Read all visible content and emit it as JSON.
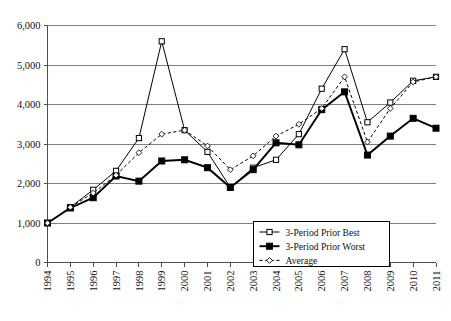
{
  "chart_data": {
    "type": "line",
    "title": "",
    "xlabel": "",
    "ylabel": "",
    "ylim": [
      0,
      6000
    ],
    "ytick_labels": [
      "0",
      "1,000",
      "2,000",
      "3,000",
      "4,000",
      "5,000",
      "6,000"
    ],
    "ytick_values": [
      0,
      1000,
      2000,
      3000,
      4000,
      5000,
      6000
    ],
    "grid": "horizontal",
    "legend_position": "bottom-right",
    "categories": [
      "1994",
      "1995",
      "1996",
      "1997",
      "1998",
      "1999",
      "2000",
      "2001",
      "2002",
      "2003",
      "2004",
      "2005",
      "2006",
      "2007",
      "2008",
      "2009",
      "2010",
      "2011"
    ],
    "series": [
      {
        "name": "3-Period Prior Best",
        "marker": "open-square",
        "line": "solid",
        "values": [
          1000,
          1400,
          1840,
          2320,
          3150,
          5600,
          3350,
          2800,
          1900,
          2400,
          2600,
          3250,
          4400,
          5400,
          3550,
          4050,
          4600,
          4700
        ]
      },
      {
        "name": "3-Period Prior Worst",
        "marker": "filled-square",
        "line": "solid-bold",
        "values": [
          1000,
          1380,
          1640,
          2190,
          2060,
          2570,
          2600,
          2400,
          1900,
          2350,
          3030,
          2980,
          3870,
          4320,
          2720,
          3200,
          3650,
          3400
        ]
      },
      {
        "name": "Average",
        "marker": "open-diamond",
        "line": "dashed",
        "values": [
          1000,
          1400,
          1760,
          2210,
          2780,
          3250,
          3350,
          2950,
          2350,
          2700,
          3200,
          3500,
          3900,
          4700,
          3050,
          3900,
          4570,
          4700
        ]
      }
    ]
  },
  "legend": {
    "items": [
      {
        "label": "3-Period Prior Best",
        "style": "open-square-solid"
      },
      {
        "label": "3-Period Prior Worst",
        "style": "filled-square-solid"
      },
      {
        "label": "Average",
        "style": "open-diamond-dashed"
      }
    ]
  }
}
